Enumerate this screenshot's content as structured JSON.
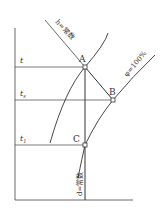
{
  "diagram": {
    "type": "psychrometric-process",
    "axis_labels": {
      "t": "t",
      "ts": "t",
      "ts_sub": "s",
      "t1": "t",
      "t1_sub": "1"
    },
    "points": {
      "A": "A",
      "B": "B",
      "C": "C"
    },
    "curve_labels": {
      "h_const": "h=常数",
      "phi_100": "φ=100%",
      "d_const": "d=常数"
    },
    "colors": {
      "line": "#333333",
      "background": "#ffffff"
    }
  }
}
